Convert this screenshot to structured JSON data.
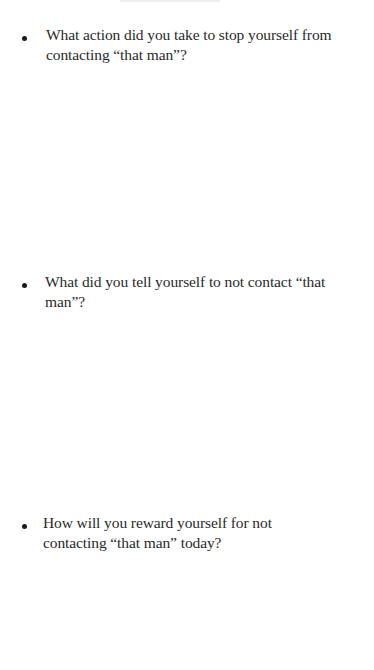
{
  "document": {
    "questions": [
      {
        "bullet": "•",
        "text": "What action did you take  to stop yourself from\ncontacting  “that man”?"
      },
      {
        "bullet": "•",
        "text": "What did you tell yourself  to not contact “that\nman”?"
      },
      {
        "bullet": "•",
        "text": "How will you reward yourself  for not\ncontacting “that man” today?"
      }
    ]
  }
}
